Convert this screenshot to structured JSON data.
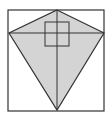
{
  "diagram": {
    "type": "geometry",
    "canvas": {
      "width": 109,
      "height": 122
    },
    "colors": {
      "background": "#ffffff",
      "stroke": "#333333",
      "kite_fill": "#d4d4d4",
      "square_fill": "none"
    },
    "rectangle": {
      "x1": 8,
      "y1": 10,
      "x2": 104,
      "y2": 111
    },
    "kite": {
      "top": [
        57,
        10
      ],
      "left": [
        9,
        33
      ],
      "bottom": [
        57,
        110
      ],
      "right": [
        104,
        33
      ]
    },
    "diagonals": {
      "vertical": {
        "x": 57,
        "y1": 10,
        "y2": 110
      },
      "horizontal": {
        "y": 33,
        "x1": 9,
        "x2": 104
      }
    },
    "small_square": {
      "x": 45,
      "y": 22,
      "size": 24
    }
  }
}
